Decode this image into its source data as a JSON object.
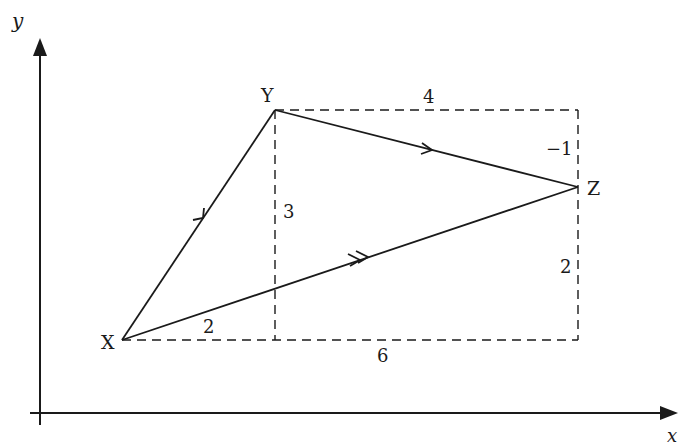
{
  "diagram": {
    "type": "vector-triangle",
    "axes": {
      "x_label": "x",
      "y_label": "y"
    },
    "points": {
      "X": {
        "label": "X"
      },
      "Y": {
        "label": "Y"
      },
      "Z": {
        "label": "Z"
      }
    },
    "vectors": [
      {
        "from": "X",
        "to": "Y",
        "components": [
          2,
          3
        ],
        "arrow": "single"
      },
      {
        "from": "Y",
        "to": "Z",
        "components": [
          4,
          -1
        ],
        "arrow": "single"
      },
      {
        "from": "X",
        "to": "Z",
        "components": [
          6,
          2
        ],
        "arrow": "double"
      }
    ],
    "dimension_labels": {
      "xy_horizontal": "2",
      "xy_vertical": "3",
      "yz_horizontal": "4",
      "yz_vertical": "−1",
      "xz_horizontal": "6",
      "xz_vertical": "2"
    },
    "colors": {
      "ink": "#1a1a1a",
      "background": "#ffffff"
    }
  }
}
